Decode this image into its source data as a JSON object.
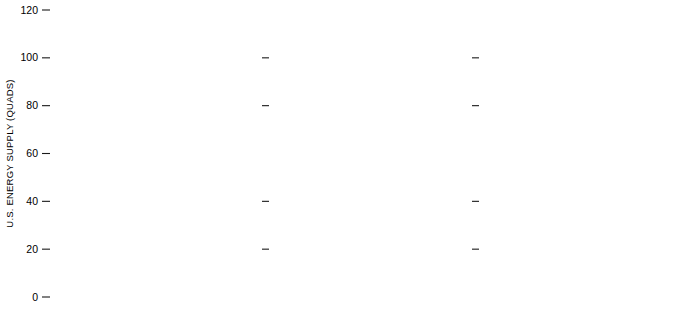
{
  "figure": {
    "title": "",
    "panel_count": 3
  },
  "axes": {
    "ylabel": "U.S. ENERGY SUPPLY (QUADS)",
    "yticks": [
      0,
      20,
      40,
      60,
      80,
      100,
      120
    ],
    "ytick_labels": [
      "0",
      "20",
      "40",
      "60",
      "80",
      "100",
      "120"
    ],
    "ylim": [
      0,
      120
    ],
    "xticks": [
      1970,
      1975,
      1980,
      1985,
      1990
    ],
    "xtick_labels_shown": [
      "1970",
      "1980",
      "1990"
    ],
    "xtick_label_years": [
      1970,
      1980,
      1990
    ],
    "xlim": [
      1970,
      1990
    ],
    "grid": false
  },
  "colors": {
    "dark_band": "#6e6e6e",
    "light_band": "#c9c9c9",
    "outline": "#111111",
    "background": "#ffffff",
    "text_dark": "#000000",
    "text_light": "#ffffff"
  },
  "panels": [
    {
      "number": "1",
      "labels": [
        {
          "key": "high_demand",
          "text": "HIGH DEMAND",
          "tone": "dark",
          "rotated": true
        },
        {
          "key": "imported_oil",
          "text_lines": [
            "IMPORTED OIL",
            "AND NATURAL GAS"
          ],
          "tone": "dark"
        },
        {
          "key": "nuclear",
          "text": "NUCLEAR",
          "tone": "dark"
        },
        {
          "key": "shale_oil",
          "text": "SHALE OIL",
          "tone": "light"
        },
        {
          "key": "natural_gas",
          "text": "NATURAL GAS",
          "tone": "light"
        },
        {
          "key": "petroleum_liquids",
          "text": "PETROLEUM LIQUIDS",
          "tone": "dark"
        },
        {
          "key": "hydro",
          "text_lines": [
            "HYDROELECTRIC",
            "GEOTHERMAL",
            "SOLAR"
          ],
          "tone": "light"
        },
        {
          "key": "coal",
          "text": "COAL",
          "tone": "light"
        }
      ]
    },
    {
      "number": "2",
      "labels": []
    },
    {
      "number": "3",
      "labels": []
    }
  ],
  "chart_data": {
    "type": "area",
    "xlabel": "",
    "ylabel": "U.S. ENERGY SUPPLY (QUADS)",
    "xlim": [
      1970,
      1990
    ],
    "ylim": [
      0,
      120
    ],
    "grid": false,
    "legend": "inline labels on panel 1",
    "x": [
      1970,
      1975,
      1980,
      1985,
      1990
    ],
    "stack_order_bottom_to_top": [
      "HYDROELECTRIC GEOTHERMAL SOLAR",
      "COAL",
      "PETROLEUM LIQUIDS",
      "NATURAL GAS",
      "SHALE OIL",
      "NUCLEAR",
      "IMPORTED OIL AND NATURAL GAS"
    ],
    "band_shades": {
      "HYDROELECTRIC GEOTHERMAL SOLAR": "light",
      "COAL": "dark",
      "PETROLEUM LIQUIDS": "light",
      "NATURAL GAS": "dark",
      "SHALE OIL": "light",
      "NUCLEAR": "dark",
      "IMPORTED OIL AND NATURAL GAS": "dark"
    },
    "panels": [
      {
        "panel": "1",
        "label": "HIGH DEMAND",
        "series": [
          {
            "name": "HYDROELECTRIC GEOTHERMAL SOLAR",
            "values": [
              3.0,
              3.2,
              3.6,
              4.0,
              4.6
            ]
          },
          {
            "name": "COAL",
            "values": [
              10.0,
              11.0,
              13.5,
              17.0,
              23.0
            ]
          },
          {
            "name": "PETROLEUM LIQUIDS",
            "values": [
              24.5,
              22.0,
              22.0,
              22.5,
              22.5
            ]
          },
          {
            "name": "NATURAL GAS",
            "values": [
              23.0,
              19.5,
              18.5,
              17.5,
              16.0
            ]
          },
          {
            "name": "SHALE OIL",
            "values": [
              0.0,
              0.5,
              1.5,
              3.0,
              5.5
            ]
          },
          {
            "name": "NUCLEAR",
            "values": [
              0.5,
              2.0,
              6.5,
              12.0,
              20.0
            ]
          },
          {
            "name": "IMPORTED OIL AND NATURAL GAS",
            "values": [
              7.0,
              13.0,
              24.0,
              29.0,
              30.0
            ]
          }
        ],
        "totals": [
          68.0,
          71.2,
          89.6,
          105.0,
          121.6
        ],
        "cumulative_tops": {
          "1970": [
            3.0,
            13.0,
            37.5,
            60.5,
            60.5,
            61.0,
            68.0
          ],
          "1975": [
            3.2,
            14.2,
            36.2,
            55.7,
            56.2,
            58.2,
            71.2
          ],
          "1980": [
            3.6,
            17.1,
            39.1,
            57.6,
            59.1,
            65.6,
            89.6
          ],
          "1985": [
            4.0,
            21.0,
            43.5,
            61.0,
            64.0,
            76.0,
            105.0
          ],
          "1990": [
            4.6,
            27.6,
            50.1,
            66.1,
            71.6,
            91.6,
            121.6
          ]
        }
      },
      {
        "panel": "2",
        "label": "",
        "series": [
          {
            "name": "HYDROELECTRIC GEOTHERMAL SOLAR",
            "values": [
              3.0,
              3.2,
              3.6,
              4.0,
              4.6
            ]
          },
          {
            "name": "COAL",
            "values": [
              10.0,
              11.0,
              12.5,
              15.5,
              21.0
            ]
          },
          {
            "name": "PETROLEUM LIQUIDS",
            "values": [
              24.5,
              22.0,
              22.5,
              23.0,
              23.5
            ]
          },
          {
            "name": "NATURAL GAS",
            "values": [
              23.0,
              20.0,
              19.0,
              18.0,
              17.0
            ]
          },
          {
            "name": "SHALE OIL",
            "values": [
              0.0,
              0.5,
              1.5,
              3.0,
              5.5
            ]
          },
          {
            "name": "NUCLEAR",
            "values": [
              0.5,
              2.0,
              5.0,
              9.0,
              14.0
            ]
          },
          {
            "name": "IMPORTED OIL AND NATURAL GAS",
            "values": [
              7.0,
              11.0,
              20.0,
              25.0,
              27.0
            ]
          }
        ],
        "totals": [
          68.0,
          69.7,
          84.1,
          97.5,
          112.6
        ],
        "cumulative_tops": {
          "1970": [
            3.0,
            13.0,
            37.5,
            60.5,
            60.5,
            61.0,
            68.0
          ],
          "1975": [
            3.2,
            14.2,
            36.2,
            56.2,
            56.7,
            58.7,
            69.7
          ],
          "1980": [
            3.6,
            16.1,
            38.6,
            57.6,
            59.1,
            64.1,
            84.1
          ],
          "1985": [
            4.0,
            19.5,
            42.5,
            60.5,
            63.5,
            72.5,
            97.5
          ],
          "1990": [
            4.6,
            25.6,
            49.1,
            66.1,
            71.6,
            85.6,
            112.6
          ]
        }
      },
      {
        "panel": "3",
        "label": "",
        "series": [
          {
            "name": "HYDROELECTRIC GEOTHERMAL SOLAR",
            "values": [
              3.0,
              3.2,
              3.6,
              4.0,
              4.6
            ]
          },
          {
            "name": "COAL",
            "values": [
              10.0,
              10.8,
              11.5,
              13.0,
              20.0
            ]
          },
          {
            "name": "PETROLEUM LIQUIDS",
            "values": [
              24.5,
              22.0,
              22.5,
              23.5,
              25.0
            ]
          },
          {
            "name": "NATURAL GAS",
            "values": [
              23.0,
              19.5,
              17.5,
              16.5,
              16.5
            ]
          },
          {
            "name": "SHALE OIL",
            "values": [
              0.0,
              0.8,
              1.5,
              2.0,
              5.0
            ]
          },
          {
            "name": "NUCLEAR",
            "values": [
              0.5,
              1.5,
              2.5,
              3.5,
              7.0
            ]
          },
          {
            "name": "IMPORTED OIL AND NATURAL GAS",
            "values": [
              7.0,
              13.5,
              26.0,
              33.0,
              36.0
            ]
          }
        ],
        "totals": [
          68.0,
          71.3,
          85.1,
          95.5,
          114.1
        ],
        "cumulative_tops": {
          "1970": [
            3.0,
            13.0,
            37.5,
            60.5,
            60.5,
            61.0,
            68.0
          ],
          "1975": [
            3.2,
            14.0,
            36.0,
            55.5,
            56.3,
            57.8,
            71.3
          ],
          "1980": [
            3.6,
            15.1,
            37.6,
            55.1,
            56.6,
            59.1,
            85.1
          ],
          "1985": [
            4.0,
            17.0,
            40.5,
            57.0,
            59.0,
            62.5,
            95.5
          ],
          "1990": [
            4.6,
            24.6,
            49.6,
            66.1,
            71.1,
            78.1,
            114.1
          ]
        }
      }
    ]
  }
}
